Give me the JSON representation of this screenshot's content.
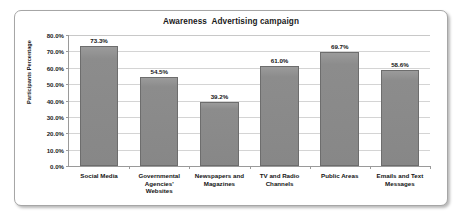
{
  "chart_data": {
    "type": "bar",
    "title": "Awareness  Advertising campaign",
    "xlabel": "",
    "ylabel": "Participants Percentage",
    "ylim": [
      0,
      80
    ],
    "ytick_labels": [
      "0.0%",
      "10.0%",
      "20.0%",
      "30.0%",
      "40.0%",
      "50.0%",
      "60.0%",
      "70.0%",
      "80.0%"
    ],
    "ytick_values": [
      0,
      10,
      20,
      30,
      40,
      50,
      60,
      70,
      80
    ],
    "grid": true,
    "legend": false,
    "categories": [
      "Social Media",
      "Governmental Agencies' Websites",
      "Newspapers and Magazines",
      "TV and Radio Channels",
      "Public Areas",
      "Emails and Text Messages"
    ],
    "values": [
      73.3,
      54.5,
      39.2,
      61.0,
      69.7,
      58.6
    ],
    "data_labels": [
      "73.3%",
      "54.5%",
      "39.2%",
      "61.0%",
      "69.7%",
      "58.6%"
    ],
    "series": [
      {
        "name": "Participants Percentage",
        "values": [
          73.3,
          54.5,
          39.2,
          61.0,
          69.7,
          58.6
        ],
        "color": "#8c8c8c"
      }
    ],
    "colors": {
      "bar_fill": "#8c8c8c",
      "bar_border": "#6d6d6d",
      "gridline": "#d4d4d4",
      "axis": "#9a9a9a",
      "plot_background": "#ffffff",
      "frame_border": "#a6a6a6",
      "text": "#141414"
    }
  }
}
